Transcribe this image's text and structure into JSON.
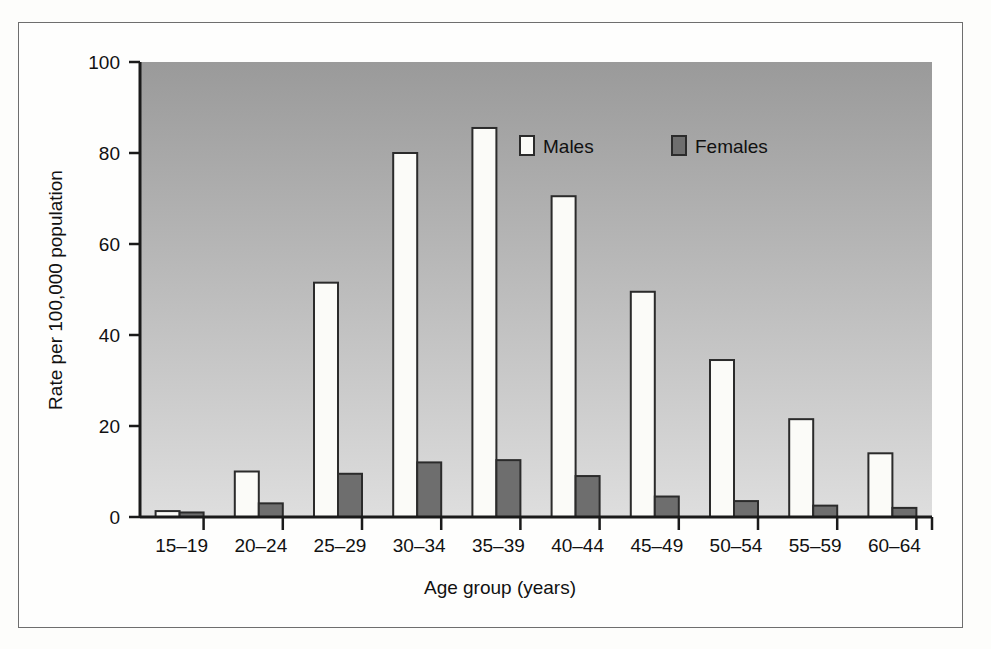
{
  "figure": {
    "background": "#fefefd",
    "frame_color": "#6e6e6e"
  },
  "chart_data": {
    "type": "bar",
    "title": "",
    "xlabel": "Age group (years)",
    "ylabel": "Rate per 100,000 population",
    "categories": [
      "15–19",
      "20–24",
      "25–29",
      "30–34",
      "35–39",
      "40–44",
      "45–49",
      "50–54",
      "55–59",
      "60–64"
    ],
    "series": [
      {
        "name": "Males",
        "color": "#fbfbf8",
        "edge": "#2b2b2b",
        "values": [
          1.3,
          10.0,
          51.5,
          80.0,
          85.5,
          70.5,
          49.5,
          34.5,
          21.5,
          14.0
        ]
      },
      {
        "name": "Females",
        "color": "#6e6e6e",
        "edge": "#2b2b2b",
        "values": [
          1.0,
          3.0,
          9.5,
          12.0,
          12.5,
          9.0,
          4.5,
          3.5,
          2.5,
          2.0
        ]
      }
    ],
    "ylim": [
      0,
      100
    ],
    "yticks": [
      0,
      20,
      40,
      60,
      80,
      100
    ],
    "ytick_labels": [
      "0",
      "20",
      "40",
      "60",
      "80",
      "100"
    ],
    "grid": false,
    "legend_position": "upper-right-inside",
    "plot_bg_top": "#9a9a9a",
    "plot_bg_bottom": "#dcdcdc"
  },
  "legend": {
    "items": [
      {
        "label": "Males",
        "swatch": "#fbfbf8"
      },
      {
        "label": "Females",
        "swatch": "#6e6e6e"
      }
    ]
  }
}
